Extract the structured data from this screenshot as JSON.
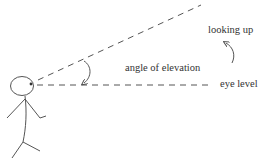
{
  "labels": {
    "looking_up": "looking up",
    "angle_of_elevation": "angle of elevation",
    "eye_level": "eye level"
  },
  "colors": {
    "stroke": "#555555",
    "text": "#333333",
    "background": "#ffffff"
  }
}
